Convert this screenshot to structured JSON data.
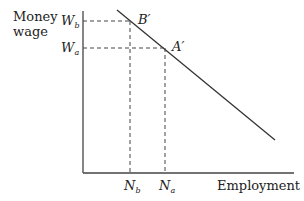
{
  "diagram": {
    "y_axis_label_line1": "Money",
    "y_axis_label_line2": "wage",
    "x_axis_label": "Employment",
    "wage_levels": [
      {
        "main": "W",
        "sub": "b"
      },
      {
        "main": "W",
        "sub": "a"
      }
    ],
    "employment_levels": [
      {
        "main": "N",
        "sub": "b"
      },
      {
        "main": "N",
        "sub": "a"
      }
    ],
    "points": [
      {
        "label": "B′"
      },
      {
        "label": "A′"
      }
    ],
    "colors": {
      "line": "#333333",
      "dashed": "#444444"
    }
  }
}
